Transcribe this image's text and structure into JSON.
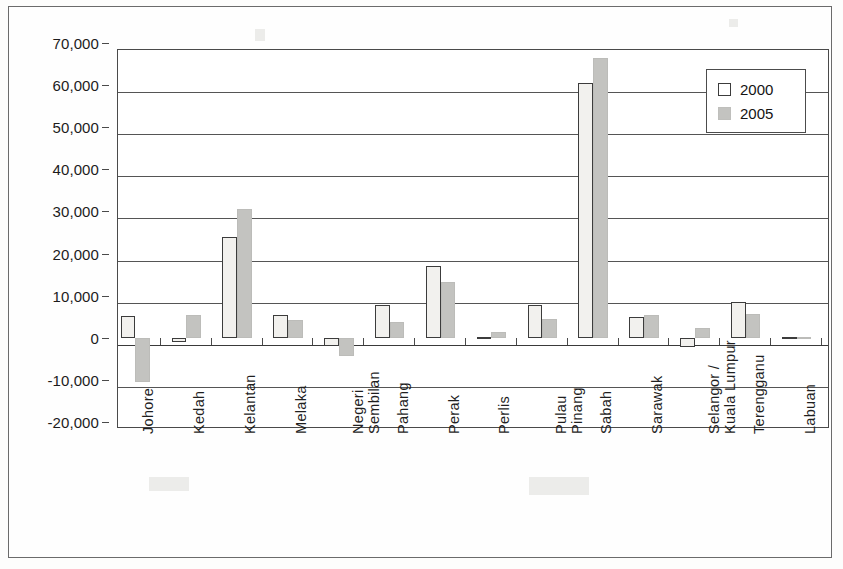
{
  "chart_data": {
    "type": "bar",
    "title": "",
    "subtitle": "",
    "xlabel": "",
    "ylabel": "",
    "grid": true,
    "legend_position": "top-right",
    "ylim": [
      -20000,
      70000
    ],
    "ytick_values": [
      70000,
      60000,
      50000,
      40000,
      30000,
      20000,
      10000,
      0,
      -10000,
      -20000
    ],
    "ytick_labels": [
      "70,000",
      "60,000",
      "50,000",
      "40,000",
      "30,000",
      "20,000",
      "10,000",
      "0",
      "-10,000",
      "-20,000"
    ],
    "categories": [
      "Johore",
      "Kedah",
      "Kelantan",
      "Melaka",
      "Negeri Sembilan",
      "Pahang",
      "Perak",
      "Perlis",
      "Pulau Pinang",
      "Sabah",
      "Sarawak",
      "Selangor / Kuala Lumpur",
      "Terengganu",
      "Labuan"
    ],
    "category_label_lines": [
      [
        "Johore"
      ],
      [
        "Kedah"
      ],
      [
        "Kelantan"
      ],
      [
        "Melaka"
      ],
      [
        "Negeri",
        "Sembilan"
      ],
      [
        "Pahang"
      ],
      [
        "Perak"
      ],
      [
        "Perlis"
      ],
      [
        "Pulau",
        "Pinang"
      ],
      [
        "Sabah"
      ],
      [
        "Sarawak"
      ],
      [
        "Selangor /",
        "Kuala Lumpur"
      ],
      [
        "Terengganu"
      ],
      [
        "Labuan"
      ]
    ],
    "series": [
      {
        "name": "2000",
        "color": "#f2f1ee",
        "values": [
          5100,
          -900,
          24000,
          5300,
          -2000,
          7700,
          17000,
          200,
          7700,
          60400,
          5000,
          -2300,
          8600,
          100
        ]
      },
      {
        "name": "2005",
        "color": "#c3c3c0",
        "values": [
          -10500,
          5500,
          30500,
          4200,
          -4300,
          3700,
          13300,
          1300,
          4500,
          66500,
          5500,
          2300,
          5600,
          300
        ]
      }
    ]
  },
  "legend": {
    "entries": [
      {
        "label": "2000"
      },
      {
        "label": "2005"
      }
    ]
  }
}
